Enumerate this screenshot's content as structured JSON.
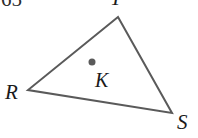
{
  "figure": {
    "type": "geometry-diagram",
    "canvas": {
      "width": 198,
      "height": 138,
      "background": "#ffffff"
    },
    "problem_number": "65",
    "shape": {
      "name": "triangle",
      "stroke_color": "#5a5a5a",
      "stroke_width": 2,
      "fill": "none",
      "vertices": [
        {
          "label": "T",
          "x": 118,
          "y": 17
        },
        {
          "label": "R",
          "x": 28,
          "y": 90
        },
        {
          "label": "S",
          "x": 172,
          "y": 113
        }
      ]
    },
    "interior_point": {
      "label": "K",
      "x": 92,
      "y": 62,
      "radius": 3.5,
      "fill": "#5a5a5a"
    },
    "labels": {
      "vertex_top": "T",
      "vertex_left": "R",
      "vertex_right": "S",
      "interior": "K"
    }
  }
}
